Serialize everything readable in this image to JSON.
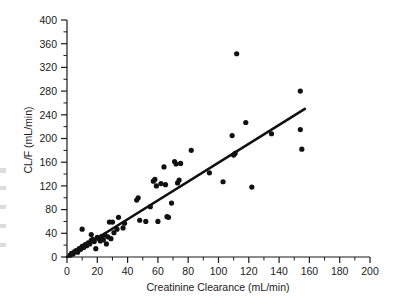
{
  "figure": {
    "background_color": "#ffffff",
    "ink_color": "#111111"
  },
  "chart_data": {
    "type": "scatter",
    "title": "",
    "subtitle": "",
    "xlabel": "Creatinine Clearance (mL/min)",
    "ylabel": "CL/F (mL/min)",
    "xlim": [
      0,
      200
    ],
    "ylim": [
      0,
      400
    ],
    "xticks": [
      0,
      20,
      40,
      60,
      80,
      100,
      120,
      140,
      160,
      180,
      200
    ],
    "yticks": [
      0,
      40,
      80,
      120,
      160,
      200,
      240,
      280,
      320,
      360,
      400
    ],
    "xtick_labels": [
      "0",
      "20",
      "40",
      "60",
      "80",
      "100",
      "120",
      "140",
      "160",
      "180",
      "200"
    ],
    "ytick_labels": [
      "0",
      "40",
      "80",
      "120",
      "160",
      "200",
      "240",
      "280",
      "320",
      "360",
      "400"
    ],
    "x_minor_tick_step": 10,
    "y_minor_tick_step": 20,
    "grid": false,
    "legend": null,
    "legend_position": "none",
    "annotations": [],
    "marker": {
      "shape": "circle",
      "color": "#111111",
      "size_px": 4.6
    },
    "series": [
      {
        "name": "Subjects",
        "points": [
          [
            2,
            3
          ],
          [
            3,
            6
          ],
          [
            4,
            5
          ],
          [
            5,
            9
          ],
          [
            6,
            11
          ],
          [
            7,
            8
          ],
          [
            8,
            14
          ],
          [
            9,
            13
          ],
          [
            10,
            47
          ],
          [
            10,
            18
          ],
          [
            11,
            16
          ],
          [
            12,
            21
          ],
          [
            13,
            19
          ],
          [
            14,
            24
          ],
          [
            15,
            22
          ],
          [
            16,
            38
          ],
          [
            16,
            28
          ],
          [
            17,
            30
          ],
          [
            18,
            26
          ],
          [
            19,
            14
          ],
          [
            20,
            33
          ],
          [
            21,
            31
          ],
          [
            22,
            27
          ],
          [
            23,
            35
          ],
          [
            24,
            29
          ],
          [
            25,
            37
          ],
          [
            26,
            22
          ],
          [
            27,
            34
          ],
          [
            28,
            59
          ],
          [
            29,
            31
          ],
          [
            30,
            59
          ],
          [
            31,
            41
          ],
          [
            33,
            47
          ],
          [
            34,
            67
          ],
          [
            37,
            49
          ],
          [
            38,
            57
          ],
          [
            46,
            96
          ],
          [
            47,
            100
          ],
          [
            48,
            62
          ],
          [
            52,
            60
          ],
          [
            55,
            85
          ],
          [
            57,
            128
          ],
          [
            58,
            131
          ],
          [
            59,
            120
          ],
          [
            60,
            60
          ],
          [
            62,
            124
          ],
          [
            64,
            152
          ],
          [
            65,
            122
          ],
          [
            66,
            68
          ],
          [
            67,
            67
          ],
          [
            69,
            91
          ],
          [
            71,
            161
          ],
          [
            72,
            157
          ],
          [
            73,
            125
          ],
          [
            74,
            130
          ],
          [
            75,
            158
          ],
          [
            82,
            180
          ],
          [
            94,
            142
          ],
          [
            103,
            127
          ],
          [
            109,
            205
          ],
          [
            110,
            172
          ],
          [
            111,
            175
          ],
          [
            112,
            343
          ],
          [
            118,
            227
          ],
          [
            122,
            118
          ],
          [
            135,
            208
          ],
          [
            154,
            280
          ],
          [
            154,
            215
          ],
          [
            155,
            182
          ]
        ]
      }
    ],
    "fit_line": {
      "type": "linear-regression",
      "x_start": 0,
      "y_start": 0,
      "x_end": 157,
      "y_end": 250,
      "color": "#111111"
    }
  }
}
